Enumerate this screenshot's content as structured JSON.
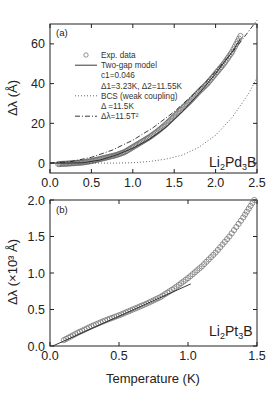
{
  "chart_data": [
    {
      "panel_label": "(a)",
      "type": "scatter",
      "title": "",
      "compound": {
        "base": "Li",
        "sub1": "2",
        "mid": "Pd",
        "sub2": "3",
        "end": "B"
      },
      "xlabel": "",
      "ylabel": "Δλ (Å)",
      "xlim": [
        0.0,
        2.5
      ],
      "ylim": [
        -5,
        70
      ],
      "xticks": [
        "0.0",
        "0.5",
        "1.0",
        "1.5",
        "2.0",
        "2.5"
      ],
      "yticks": [
        "0",
        "20",
        "40",
        "60"
      ],
      "legend": [
        {
          "symbol": "circle",
          "label": "Exp. data"
        },
        {
          "symbol": "solid",
          "label": "Two-gap model"
        },
        {
          "symbol": "none",
          "label": "c1=0.046"
        },
        {
          "symbol": "none",
          "label": "Δ1=3.23K,  Δ2=11.55K"
        },
        {
          "symbol": "dotted",
          "label": "BCS (weak coupling)"
        },
        {
          "symbol": "none",
          "label": "Δ =11.5K"
        },
        {
          "symbol": "dashdot",
          "label": "Δλ=11.5T²"
        }
      ],
      "series": [
        {
          "name": "Exp. data",
          "style": "circle",
          "x": [
            0.1,
            0.2,
            0.3,
            0.4,
            0.5,
            0.6,
            0.7,
            0.8,
            0.9,
            1.0,
            1.1,
            1.2,
            1.3,
            1.4,
            1.5,
            1.6,
            1.7,
            1.8,
            1.9,
            2.0,
            2.1,
            2.2,
            2.3
          ],
          "y": [
            -0.5,
            -0.3,
            0.0,
            0.3,
            1.0,
            2.0,
            3.0,
            4.0,
            5.5,
            8.0,
            10.5,
            13.0,
            16.0,
            19.5,
            23.5,
            27.5,
            31.5,
            36.0,
            40.0,
            45.0,
            50.0,
            56.0,
            64.0
          ]
        },
        {
          "name": "Two-gap model",
          "style": "solid",
          "x": [
            0.0,
            0.2,
            0.4,
            0.6,
            0.8,
            1.0,
            1.2,
            1.4,
            1.6,
            1.8,
            2.0,
            2.2,
            2.3
          ],
          "y": [
            0.0,
            0.0,
            0.2,
            1.5,
            4.0,
            7.5,
            12.0,
            18.0,
            26.0,
            35.0,
            45.0,
            56.0,
            62.5
          ]
        },
        {
          "name": "BCS (weak coupling)",
          "style": "dotted",
          "x": [
            0.0,
            0.8,
            1.0,
            1.2,
            1.4,
            1.6,
            1.8,
            2.0,
            2.2,
            2.4,
            2.5
          ],
          "y": [
            0.0,
            0.0,
            0.2,
            0.8,
            2.0,
            4.0,
            8.0,
            14.0,
            23.0,
            35.0,
            43.0
          ]
        },
        {
          "name": "Δλ=11.5T²",
          "style": "dashdot",
          "x": [
            0.0,
            0.25,
            0.5,
            0.75,
            1.0,
            1.25,
            1.5,
            1.75,
            2.0,
            2.25,
            2.5
          ],
          "y": [
            0.0,
            0.72,
            2.88,
            6.47,
            11.5,
            17.97,
            25.88,
            35.22,
            46.0,
            58.22,
            71.88
          ]
        }
      ]
    },
    {
      "panel_label": "(b)",
      "type": "scatter",
      "title": "",
      "compound": {
        "base": "Li",
        "sub1": "2",
        "mid": "Pt",
        "sub2": "3",
        "end": "B"
      },
      "xlabel": "Temperature (K)",
      "ylabel": "Δλ (×10³ Å)",
      "xlim": [
        0.0,
        1.5
      ],
      "ylim": [
        0.0,
        2.0
      ],
      "xticks": [
        "0.0",
        "0.5",
        "1.0",
        "1.5"
      ],
      "yticks": [
        "0.0",
        "0.5",
        "1.0",
        "1.5",
        "2.0"
      ],
      "series": [
        {
          "name": "Exp. data",
          "style": "circle",
          "x": [
            0.1,
            0.2,
            0.3,
            0.4,
            0.5,
            0.6,
            0.7,
            0.8,
            0.9,
            1.0,
            1.1,
            1.2,
            1.3,
            1.4,
            1.48
          ],
          "y": [
            0.08,
            0.18,
            0.27,
            0.35,
            0.42,
            0.5,
            0.58,
            0.67,
            0.79,
            0.93,
            1.09,
            1.28,
            1.5,
            1.76,
            2.0
          ]
        },
        {
          "name": "Linear fit",
          "style": "solid",
          "x": [
            0.02,
            1.02
          ],
          "y": [
            0.0,
            0.85
          ]
        }
      ]
    }
  ]
}
